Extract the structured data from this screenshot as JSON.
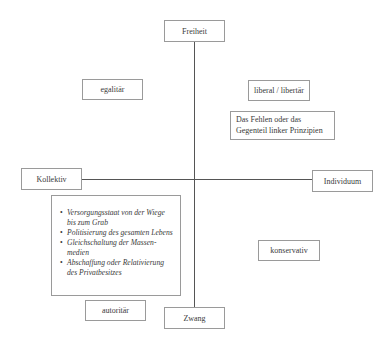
{
  "diagram": {
    "axes": {
      "top": "Freiheit",
      "bottom": "Zwang",
      "left": "Kollektiv",
      "right": "Individuum"
    },
    "quadrant_labels": {
      "top_left": "egalitär",
      "top_right": "liberal / libertär",
      "top_right_note": [
        "Das Fehlen oder das",
        "Gegenteil linker Prinzipien"
      ],
      "bottom_right": "konservativ",
      "bottom_left": "autoritär"
    },
    "bottom_left_list": [
      "Versorgungsstaat von der Wiege bis zum Grab",
      "Politisierung des gesamten Lebens",
      "Gleichschaltung der Massen-medien",
      "Abschaffung oder Relativierung des Privatbesitzes"
    ]
  }
}
